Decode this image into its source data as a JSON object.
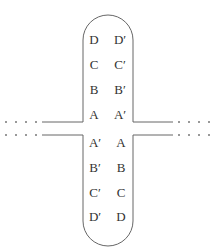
{
  "diagram": {
    "colors": {
      "line": "#666666",
      "text": "#333333",
      "dots": "#777777"
    },
    "top_loop": {
      "left_column": [
        "D",
        "C",
        "B",
        "A"
      ],
      "right_column": [
        "D′",
        "C′",
        "B′",
        "A′"
      ]
    },
    "bottom_loop": {
      "left_column": [
        "A′",
        "B′",
        "C′",
        "D′"
      ],
      "right_column": [
        "A",
        "B",
        "C",
        "D"
      ]
    },
    "ellipsis": "····"
  }
}
